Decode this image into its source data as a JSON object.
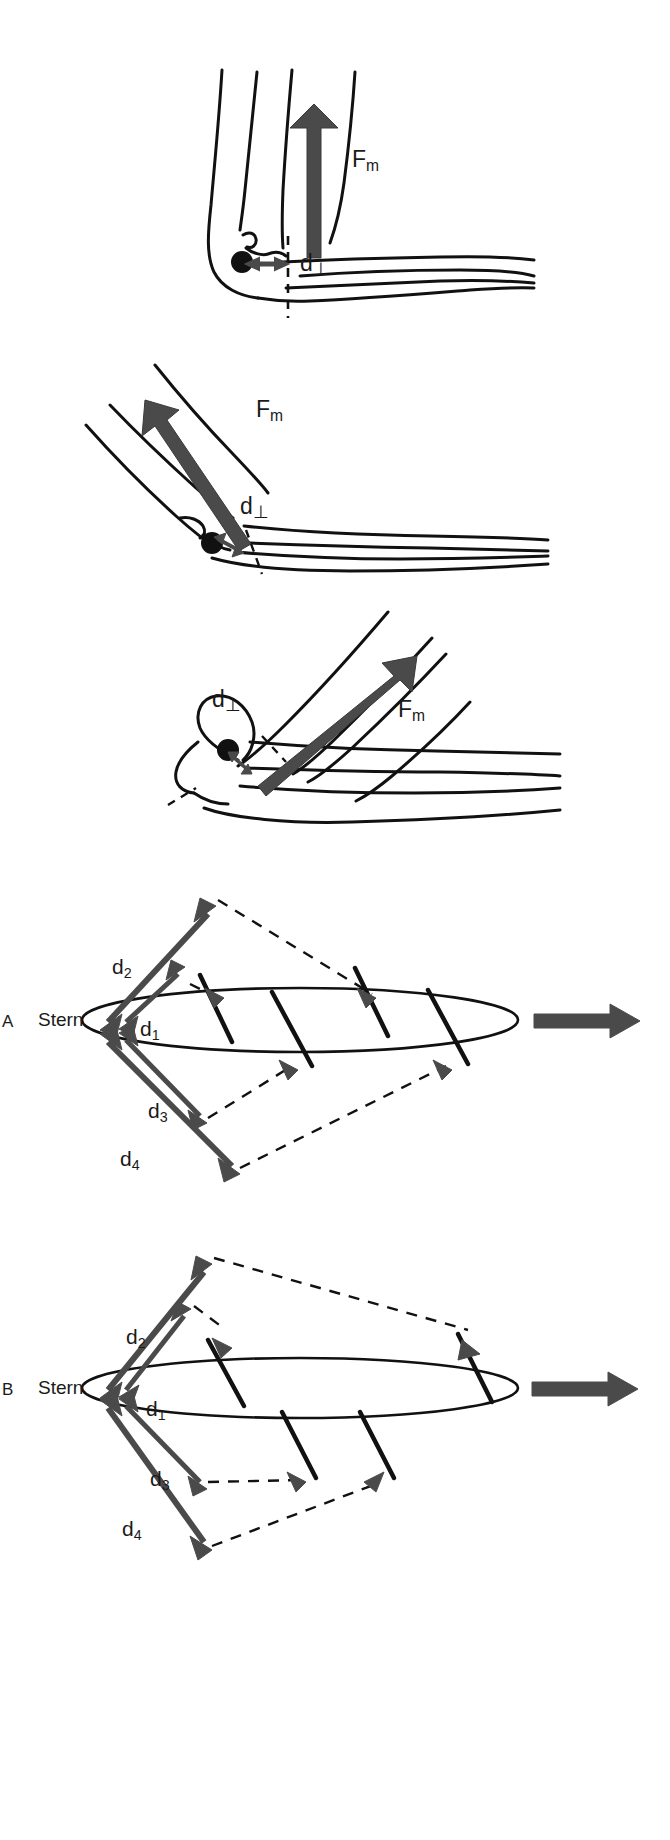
{
  "figure": {
    "type": "scientific-illustration",
    "background_color": "#ffffff",
    "ink_color": "#111111",
    "arrow_color": "#4a4a4a",
    "arrow_color_dark": "#3d3d3d",
    "bone_line_color": "#111111"
  },
  "elbow_panels": [
    {
      "id": "elbow-extended",
      "flexion": "near full extension",
      "force_label": "F",
      "force_sub": "m",
      "moment_label": "d",
      "moment_sub": "⊥",
      "force_direction_deg": 90,
      "moment_arm_orientation": "horizontal",
      "has_dashed_joint_axis": true
    },
    {
      "id": "elbow-mid-flexion",
      "flexion": "mid flexion",
      "force_label": "F",
      "force_sub": "m",
      "moment_label": "d",
      "moment_sub": "⊥",
      "force_direction_deg": 40,
      "moment_arm_orientation": "oblique",
      "has_dashed_joint_axis": true
    },
    {
      "id": "elbow-flexed",
      "flexion": "high flexion",
      "force_label": "F",
      "force_sub": "m",
      "moment_label": "d",
      "moment_sub": "⊥",
      "force_direction_deg": 35,
      "moment_arm_orientation": "oblique-short",
      "has_dashed_joint_axis": true
    }
  ],
  "ribcage_panels": [
    {
      "letter": "A",
      "sternum_label": "Stern",
      "vectors": [
        {
          "name": "d",
          "sub": "2",
          "label_x": 118,
          "label_y": 100
        },
        {
          "name": "d",
          "sub": "1",
          "label_x": 140,
          "label_y": 163
        },
        {
          "name": "d",
          "sub": "3",
          "label_x": 148,
          "label_y": 242
        },
        {
          "name": "d",
          "sub": "4",
          "label_x": 120,
          "label_y": 288
        }
      ],
      "cranial_direction_arrow": true,
      "rib_count": 4
    },
    {
      "letter": "B",
      "sternum_label": "Stern",
      "vectors": [
        {
          "name": "d",
          "sub": "2",
          "label_x": 128,
          "label_y": 108
        },
        {
          "name": "d",
          "sub": "1",
          "label_x": 143,
          "label_y": 180
        },
        {
          "name": "d",
          "sub": "3",
          "label_x": 148,
          "label_y": 250
        },
        {
          "name": "d",
          "sub": "4",
          "label_x": 122,
          "label_y": 297
        }
      ],
      "cranial_direction_arrow": true,
      "rib_count": 4
    }
  ],
  "labels": {
    "force_moment": "F",
    "force_subscript": "m",
    "distance": "d",
    "perp_subscript": "⊥",
    "sternum": "Stern",
    "panel_a": "A",
    "panel_b": "B",
    "sub1": "1",
    "sub2": "2",
    "sub3": "3",
    "sub4": "4"
  }
}
